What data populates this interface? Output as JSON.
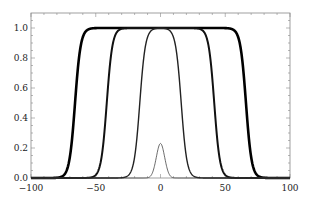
{
  "chart_data": {
    "type": "line",
    "title": "",
    "xlabel": "",
    "ylabel": "",
    "xlim": [
      -100,
      100
    ],
    "ylim": [
      0,
      1.1
    ],
    "grid": false,
    "legend": null,
    "x_ticks": [
      -100,
      -50,
      0,
      50,
      100
    ],
    "x_tick_labels": [
      "−100",
      "−50",
      "0",
      "50",
      "100"
    ],
    "y_ticks": [
      0.0,
      0.2,
      0.4,
      0.6,
      0.8,
      1.0
    ],
    "y_tick_labels": [
      "0.0",
      "0.2",
      "0.4",
      "0.6",
      "0.8",
      "1.0"
    ],
    "series": [
      {
        "name": "plateau-wide",
        "shape": "flat-top",
        "half_width": 66,
        "edge_softness": 2.2,
        "height": 1.0,
        "line_width": 2.6,
        "color": "#000000"
      },
      {
        "name": "plateau-medium",
        "shape": "flat-top",
        "half_width": 41.5,
        "edge_softness": 2.2,
        "height": 1.0,
        "line_width": 2.0,
        "color": "#111111"
      },
      {
        "name": "plateau-narrow",
        "shape": "flat-top",
        "half_width": 16,
        "edge_softness": 2.2,
        "height": 1.0,
        "line_width": 1.4,
        "color": "#222222"
      },
      {
        "name": "gaussian-peak",
        "shape": "gaussian",
        "center": 0,
        "sigma": 3.2,
        "height": 0.23,
        "line_width": 0.8,
        "color": "#444444"
      }
    ]
  }
}
